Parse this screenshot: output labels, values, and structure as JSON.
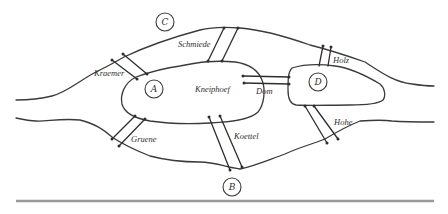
{
  "diagram": {
    "landmasses": [
      {
        "id": "A",
        "label": "A",
        "name": "Kneiphoef"
      },
      {
        "id": "B",
        "label": "B"
      },
      {
        "id": "C",
        "label": "C"
      },
      {
        "id": "D",
        "label": "D"
      }
    ],
    "island_label": "Kneiphoef",
    "bridges": [
      {
        "name": "Kraemer",
        "connects": [
          "A",
          "C"
        ]
      },
      {
        "name": "Schmiede",
        "connects": [
          "A",
          "C"
        ]
      },
      {
        "name": "Holz",
        "connects": [
          "D",
          "C"
        ]
      },
      {
        "name": "Dom",
        "connects": [
          "A",
          "D"
        ]
      },
      {
        "name": "Gruene",
        "connects": [
          "A",
          "B"
        ]
      },
      {
        "name": "Koettel",
        "connects": [
          "A",
          "B"
        ]
      },
      {
        "name": "Hohe",
        "connects": [
          "D",
          "B"
        ]
      }
    ],
    "colors": {
      "ink": "#2e2e2e",
      "background": "#ffffff",
      "baseline": "#9a9a9a"
    }
  }
}
